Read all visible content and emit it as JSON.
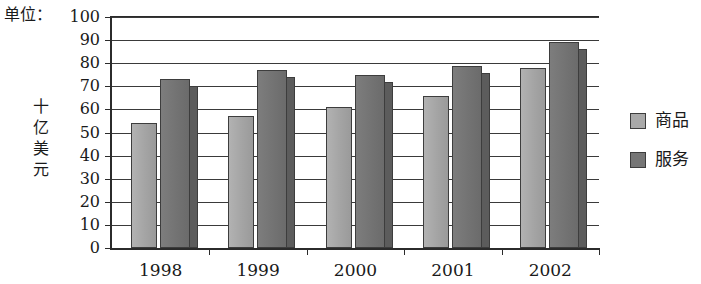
{
  "unit_caption": "单位：",
  "y_axis_title_chars": [
    "十",
    "亿",
    "美",
    "元"
  ],
  "legend": {
    "items": [
      {
        "label": "商品",
        "color": "#a9a9a9"
      },
      {
        "label": "服务",
        "color": "#767676"
      }
    ]
  },
  "chart_data": {
    "type": "bar",
    "title": "",
    "subtitle": "",
    "xlabel": "",
    "ylabel": "十亿美元",
    "unit_note": "单位：",
    "categories": [
      "1998",
      "1999",
      "2000",
      "2001",
      "2002"
    ],
    "series": [
      {
        "name": "商品",
        "color": "#a9a9a9",
        "values": [
          54,
          57,
          61,
          66,
          78
        ]
      },
      {
        "name": "服务",
        "color": "#767676",
        "values": [
          73,
          77,
          75,
          79,
          89
        ]
      }
    ],
    "ylim": [
      0,
      100
    ],
    "y_ticks": [
      0,
      10,
      20,
      30,
      40,
      50,
      60,
      70,
      80,
      90,
      100
    ],
    "y_tick_labels": [
      "0",
      "10",
      "20",
      "30",
      "40",
      "50",
      "60",
      "70",
      "80",
      "90",
      "100"
    ],
    "grid": true,
    "grid_axis": "y",
    "legend_position": "right",
    "style": "3d-shaded-bars"
  }
}
